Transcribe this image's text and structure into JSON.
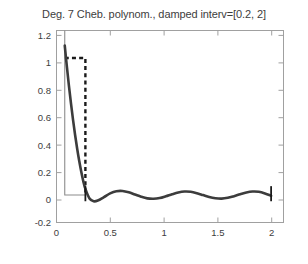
{
  "chart_data": {
    "type": "line",
    "title": "Deg. 7 Cheb. polynom., damped interv=[0.2, 2]",
    "xlabel": "",
    "ylabel": "",
    "xlim": [
      -0.08,
      2.12
    ],
    "ylim": [
      -0.2,
      1.2
    ],
    "xticks": [
      0,
      0.5,
      1,
      1.5,
      2
    ],
    "xtick_labels": [
      "0",
      "0.5",
      "1",
      "1.5",
      "2"
    ],
    "yticks": [
      -0.2,
      0,
      0.2,
      0.4,
      0.6,
      0.8,
      1,
      1.2
    ],
    "ytick_labels": [
      "-0.2",
      "0",
      "0.2",
      "0.4",
      "0.6",
      "0.8",
      "1",
      "1.2"
    ],
    "grid": false,
    "legend": "none",
    "damped_interval": [
      0.2,
      2
    ],
    "degree": 7,
    "series": [
      {
        "name": "target step function",
        "style": "dashed",
        "color": "#1a1a1a",
        "x": [
          0,
          0.2,
          0.2
        ],
        "y": [
          1,
          1,
          0
        ]
      },
      {
        "name": "reference baseline",
        "style": "solid-thin",
        "color": "#8c8c8c",
        "x": [
          0,
          0,
          0.2
        ],
        "y": [
          1.2,
          0,
          0
        ]
      },
      {
        "name": "degree 7 Chebyshev polynomial",
        "style": "solid-thick",
        "color": "#3c3c3c",
        "x": [
          0.0,
          0.02,
          0.04,
          0.06,
          0.08,
          0.1,
          0.12,
          0.14,
          0.16,
          0.18,
          0.2,
          0.24,
          0.28,
          0.32,
          0.38,
          0.44,
          0.5,
          0.56,
          0.62,
          0.68,
          0.74,
          0.8,
          0.86,
          0.92,
          0.98,
          1.04,
          1.1,
          1.16,
          1.22,
          1.28,
          1.34,
          1.4,
          1.46,
          1.52,
          1.58,
          1.64,
          1.7,
          1.76,
          1.82,
          1.88,
          1.94,
          2.0
        ],
        "y": [
          1.09,
          0.94,
          0.8,
          0.67,
          0.55,
          0.44,
          0.34,
          0.25,
          0.17,
          0.1,
          0.045,
          -0.025,
          -0.045,
          -0.04,
          -0.015,
          0.012,
          0.028,
          0.03,
          0.02,
          0.004,
          -0.012,
          -0.024,
          -0.027,
          -0.022,
          -0.009,
          0.006,
          0.019,
          0.026,
          0.024,
          0.014,
          0.0,
          -0.014,
          -0.023,
          -0.026,
          -0.02,
          -0.008,
          0.006,
          0.019,
          0.026,
          0.024,
          0.012,
          -0.005
        ]
      }
    ],
    "markers": [
      {
        "name": "left-interval-marker",
        "x": 0.2,
        "y_from": -0.045,
        "y_to": 0.065,
        "color": "#1a1a1a"
      },
      {
        "name": "right-interval-marker",
        "x": 2.0,
        "y_from": -0.045,
        "y_to": 0.065,
        "color": "#1a1a1a"
      }
    ]
  }
}
